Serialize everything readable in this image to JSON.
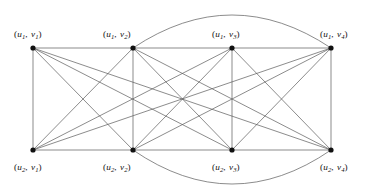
{
  "figure": {
    "background_color": "#ffffff",
    "edge_color": "#5a5a5a",
    "vertex_color": "#111111",
    "label_color": "#111111"
  },
  "chart_data": {
    "type": "diagram",
    "subtype": "graph",
    "title": "",
    "xlabel": "",
    "ylabel": "",
    "grid": false,
    "legend": false,
    "vertices": [
      {
        "id": "u1v1",
        "label_u": "u",
        "label_u_sub": "1",
        "label_v": "v",
        "label_v_sub": "1",
        "x": 33,
        "y": 48,
        "row": "top",
        "label_x": 14,
        "label_y": 30
      },
      {
        "id": "u1v2",
        "label_u": "u",
        "label_u_sub": "1",
        "label_v": "v",
        "label_v_sub": "2",
        "x": 133,
        "y": 48,
        "row": "top",
        "label_x": 103,
        "label_y": 30
      },
      {
        "id": "u1v3",
        "label_u": "u",
        "label_u_sub": "1",
        "label_v": "v",
        "label_v_sub": "3",
        "x": 232,
        "y": 48,
        "row": "top",
        "label_x": 212,
        "label_y": 30
      },
      {
        "id": "u1v4",
        "label_u": "u",
        "label_u_sub": "1",
        "label_v": "v",
        "label_v_sub": "4",
        "x": 331,
        "y": 48,
        "row": "top",
        "label_x": 320,
        "label_y": 30
      },
      {
        "id": "u2v1",
        "label_u": "u",
        "label_u_sub": "2",
        "label_v": "v",
        "label_v_sub": "1",
        "x": 33,
        "y": 150,
        "row": "bottom",
        "label_x": 14,
        "label_y": 163
      },
      {
        "id": "u2v2",
        "label_u": "u",
        "label_u_sub": "2",
        "label_v": "v",
        "label_v_sub": "2",
        "x": 133,
        "y": 150,
        "row": "bottom",
        "label_x": 103,
        "label_y": 163
      },
      {
        "id": "u2v3",
        "label_u": "u",
        "label_u_sub": "2",
        "label_v": "v",
        "label_v_sub": "3",
        "x": 232,
        "y": 150,
        "row": "bottom",
        "label_x": 212,
        "label_y": 163
      },
      {
        "id": "u2v4",
        "label_u": "u",
        "label_u_sub": "2",
        "label_v": "v",
        "label_v_sub": "4",
        "x": 331,
        "y": 150,
        "row": "bottom",
        "label_x": 320,
        "label_y": 163
      }
    ],
    "straight_edges": [
      [
        "u1v1",
        "u1v2"
      ],
      [
        "u1v2",
        "u1v3"
      ],
      [
        "u1v3",
        "u1v4"
      ],
      [
        "u2v1",
        "u2v2"
      ],
      [
        "u2v2",
        "u2v3"
      ],
      [
        "u2v3",
        "u2v4"
      ],
      [
        "u1v1",
        "u2v1"
      ],
      [
        "u1v2",
        "u2v2"
      ],
      [
        "u1v3",
        "u2v3"
      ],
      [
        "u1v4",
        "u2v4"
      ],
      [
        "u1v1",
        "u2v2"
      ],
      [
        "u1v1",
        "u2v3"
      ],
      [
        "u1v1",
        "u2v4"
      ],
      [
        "u1v2",
        "u2v1"
      ],
      [
        "u1v2",
        "u2v3"
      ],
      [
        "u1v2",
        "u2v4"
      ],
      [
        "u1v3",
        "u2v1"
      ],
      [
        "u1v3",
        "u2v2"
      ],
      [
        "u1v3",
        "u2v4"
      ],
      [
        "u1v4",
        "u2v1"
      ],
      [
        "u1v4",
        "u2v2"
      ],
      [
        "u1v4",
        "u2v3"
      ]
    ],
    "curved_edges": [
      {
        "from": "u1v2",
        "to": "u1v4",
        "control_x": 232,
        "control_y": -18,
        "side": "top"
      },
      {
        "from": "u2v2",
        "to": "u2v4",
        "control_x": 232,
        "control_y": 218,
        "side": "bottom"
      }
    ],
    "vertex_radius": 2.6,
    "edge_width": 0.7
  }
}
